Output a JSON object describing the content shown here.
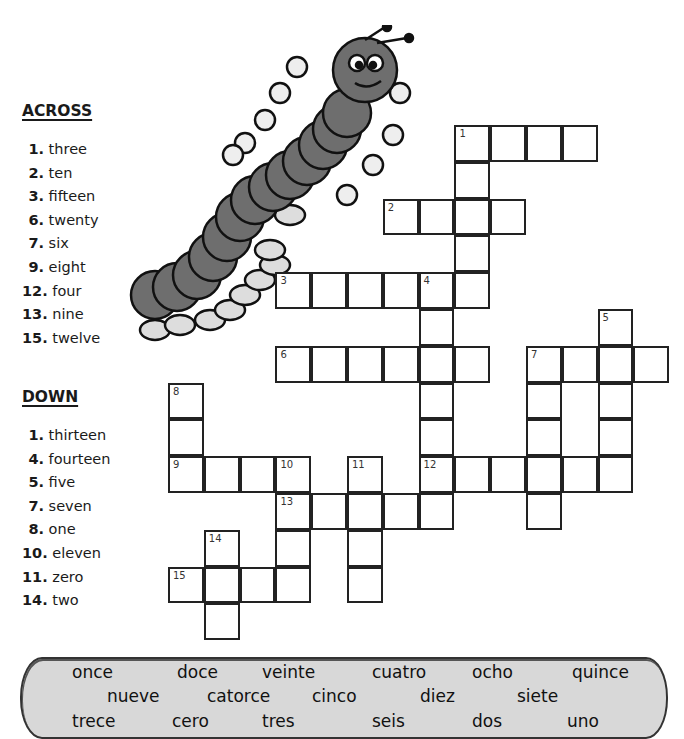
{
  "across": {
    "title": "ACROSS",
    "clues": [
      {
        "num": "1.",
        "text": "three"
      },
      {
        "num": "2.",
        "text": "ten"
      },
      {
        "num": "3.",
        "text": "fifteen"
      },
      {
        "num": "6.",
        "text": "twenty"
      },
      {
        "num": "7.",
        "text": "six"
      },
      {
        "num": "9.",
        "text": "eight"
      },
      {
        "num": "12.",
        "text": "four"
      },
      {
        "num": "13.",
        "text": "nine"
      },
      {
        "num": "15.",
        "text": "twelve"
      }
    ]
  },
  "down": {
    "title": "DOWN",
    "clues": [
      {
        "num": "1.",
        "text": "thirteen"
      },
      {
        "num": "4.",
        "text": "fourteen"
      },
      {
        "num": "5.",
        "text": "five"
      },
      {
        "num": "7.",
        "text": "seven"
      },
      {
        "num": "8.",
        "text": "one"
      },
      {
        "num": "10.",
        "text": "eleven"
      },
      {
        "num": "11.",
        "text": "zero"
      },
      {
        "num": "14.",
        "text": "two"
      }
    ]
  },
  "grid": {
    "words": [
      {
        "num": "1",
        "dir": "across",
        "row": 0,
        "col": 8,
        "len": 4
      },
      {
        "num": "1",
        "dir": "down",
        "row": 0,
        "col": 8,
        "len": 5
      },
      {
        "num": "2",
        "dir": "across",
        "row": 2,
        "col": 6,
        "len": 4
      },
      {
        "num": "3",
        "dir": "across",
        "row": 4,
        "col": 3,
        "len": 6
      },
      {
        "num": "4",
        "dir": "down",
        "row": 4,
        "col": 7,
        "len": 7
      },
      {
        "num": "5",
        "dir": "down",
        "row": 5,
        "col": 12,
        "len": 5
      },
      {
        "num": "6",
        "dir": "across",
        "row": 6,
        "col": 3,
        "len": 6
      },
      {
        "num": "7",
        "dir": "across",
        "row": 6,
        "col": 10,
        "len": 4
      },
      {
        "num": "7",
        "dir": "down",
        "row": 6,
        "col": 10,
        "len": 5
      },
      {
        "num": "8",
        "dir": "down",
        "row": 7,
        "col": 0,
        "len": 3
      },
      {
        "num": "9",
        "dir": "across",
        "row": 9,
        "col": 0,
        "len": 4
      },
      {
        "num": "10",
        "dir": "down",
        "row": 9,
        "col": 3,
        "len": 4
      },
      {
        "num": "11",
        "dir": "down",
        "row": 9,
        "col": 5,
        "len": 4
      },
      {
        "num": "12",
        "dir": "across",
        "row": 9,
        "col": 7,
        "len": 6
      },
      {
        "num": "13",
        "dir": "across",
        "row": 10,
        "col": 3,
        "len": 5
      },
      {
        "num": "14",
        "dir": "down",
        "row": 11,
        "col": 1,
        "len": 3
      },
      {
        "num": "15",
        "dir": "across",
        "row": 12,
        "col": 0,
        "len": 4
      }
    ]
  },
  "word_bank": {
    "rows": [
      [
        "once",
        "doce",
        "veinte",
        "cuatro",
        "ocho",
        "quince"
      ],
      [
        "nueve",
        "catorce",
        "cinco",
        "diez",
        "siete"
      ],
      [
        "trece",
        "cero",
        "tres",
        "seis",
        "dos",
        "uno"
      ]
    ]
  }
}
